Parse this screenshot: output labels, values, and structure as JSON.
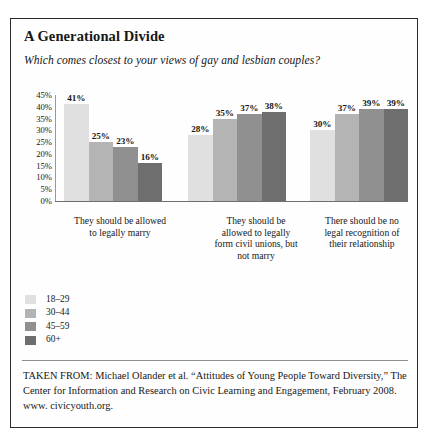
{
  "figure": {
    "title": "A Generational Divide",
    "question": "Which comes closest to your views of gay and lesbian couples?",
    "source_note": "TAKEN FROM: Michael Olander et al. “Attitudes of Young People Toward Diversity,” The Center for Information and Research on Civic Learning and Engagement, February 2008. www. civicyouth.org."
  },
  "chart_data": {
    "type": "bar",
    "title": "A Generational Divide",
    "subtitle": "Which comes closest to your views of gay and lesbian couples?",
    "xlabel": "",
    "ylabel": "",
    "ylim": [
      0,
      45
    ],
    "grid": false,
    "legend_position": "bottom-left",
    "orientation": "vertical",
    "grouped": true,
    "y_ticks": [
      "0%",
      "5%",
      "10%",
      "15%",
      "20%",
      "25%",
      "30%",
      "35%",
      "40%",
      "45%"
    ],
    "y_tick_values": [
      0,
      5,
      10,
      15,
      20,
      25,
      30,
      35,
      40,
      45
    ],
    "categories": [
      "They should be allowed to legally marry",
      "They should be allowed to legally form civil unions, but not marry",
      "There should be no legal recognition of their relationship"
    ],
    "category_lines": [
      [
        "They should be allowed",
        "to legally marry"
      ],
      [
        "They should be",
        "allowed to legally",
        "form civil unions, but",
        "not marry"
      ],
      [
        "There should be no",
        "legal recognition of",
        "their relationship"
      ]
    ],
    "series": [
      {
        "name": "18–29",
        "color": "#e0e0e0",
        "values": [
          41,
          28,
          30
        ],
        "labels": [
          "41%",
          "28%",
          "30%"
        ]
      },
      {
        "name": "30–44",
        "color": "#b4b4b4",
        "values": [
          25,
          35,
          37
        ],
        "labels": [
          "25%",
          "35%",
          "37%"
        ]
      },
      {
        "name": "45–59",
        "color": "#909090",
        "values": [
          23,
          37,
          39
        ],
        "labels": [
          "23%",
          "37%",
          "39%"
        ]
      },
      {
        "name": "60+",
        "color": "#6e6e6e",
        "values": [
          16,
          38,
          39
        ],
        "labels": [
          "16%",
          "38%",
          "39%"
        ]
      }
    ]
  }
}
